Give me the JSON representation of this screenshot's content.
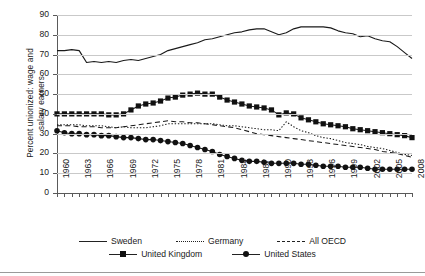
{
  "chart_data": {
    "type": "line",
    "title": "",
    "xlabel": "",
    "ylabel": "Percent unionized: wage and salary earners",
    "ylabel_line1": "Percent unionized: wage and",
    "ylabel_line2": "salary earners",
    "ylim": [
      0,
      90
    ],
    "ytick_step": 10,
    "yticks": [
      0,
      10,
      20,
      30,
      40,
      50,
      60,
      70,
      80,
      90
    ],
    "xlim": [
      1960,
      2008
    ],
    "xtick_step": 1,
    "xlabel_step": 3,
    "xticklabels": [
      "1960",
      "1963",
      "1966",
      "1969",
      "1972",
      "1975",
      "1978",
      "1981",
      "1984",
      "1987",
      "1990",
      "1993",
      "1996",
      "1999",
      "2002",
      "2005",
      "2008"
    ],
    "grid": "horizontal",
    "legend_position": "bottom",
    "x": [
      1960,
      1961,
      1962,
      1963,
      1964,
      1965,
      1966,
      1967,
      1968,
      1969,
      1970,
      1971,
      1972,
      1973,
      1974,
      1975,
      1976,
      1977,
      1978,
      1979,
      1980,
      1981,
      1982,
      1983,
      1984,
      1985,
      1986,
      1987,
      1988,
      1989,
      1990,
      1991,
      1992,
      1993,
      1994,
      1995,
      1996,
      1997,
      1998,
      1999,
      2000,
      2001,
      2002,
      2003,
      2004,
      2005,
      2006,
      2007,
      2008
    ],
    "series": [
      {
        "name": "Sweden",
        "style": "solid",
        "marker": "none",
        "values": [
          72,
          72,
          72.5,
          72,
          66,
          66.5,
          66,
          66.5,
          66,
          67,
          67.5,
          67,
          68,
          69,
          70,
          72,
          73,
          74,
          75,
          76,
          77.5,
          78,
          79,
          80,
          81,
          81.5,
          82.5,
          83,
          83,
          81.5,
          80,
          81,
          83,
          84,
          84,
          84,
          84,
          83.5,
          82,
          81,
          80.5,
          79,
          79.5,
          78,
          77,
          76.5,
          74,
          71,
          68
        ]
      },
      {
        "name": "Germany",
        "style": "dotted",
        "marker": "none",
        "values": [
          34.5,
          34.5,
          34.5,
          34.5,
          34,
          34,
          34,
          33.5,
          33,
          33.5,
          33,
          33,
          33,
          33.5,
          34,
          35,
          35,
          35,
          35,
          35,
          35,
          35,
          34.5,
          34,
          34,
          33.5,
          33,
          32.5,
          32,
          32,
          31.5,
          36,
          33.5,
          31.5,
          30.5,
          29,
          28,
          27.5,
          26.5,
          25.5,
          25,
          24.5,
          23.5,
          23,
          22.5,
          21.5,
          20.5,
          19.5,
          19
        ]
      },
      {
        "name": "All OECD",
        "style": "dashed",
        "marker": "none",
        "values": [
          34,
          34,
          34,
          33.5,
          33.5,
          33.5,
          33,
          33,
          33,
          33.5,
          34,
          34.5,
          35,
          35.5,
          36,
          36.5,
          36,
          36,
          35.5,
          35.5,
          35,
          34.5,
          34,
          33.5,
          33,
          32,
          31,
          30,
          29.5,
          29,
          28.5,
          28,
          27.5,
          27,
          26.5,
          26,
          25.5,
          25,
          24.5,
          24,
          23.5,
          23,
          22.5,
          22,
          21,
          20.5,
          20,
          19,
          18
        ]
      },
      {
        "name": "United Kingdom",
        "style": "solid",
        "marker": "square",
        "values": [
          40,
          40,
          40,
          40,
          40,
          40,
          40,
          39.5,
          39.5,
          40,
          42,
          44,
          45,
          45.5,
          46.5,
          48,
          48.5,
          49.5,
          50,
          50.5,
          50,
          50,
          48.5,
          47,
          46,
          45,
          44,
          43.5,
          43,
          42,
          39.5,
          40.5,
          40,
          38,
          37,
          36,
          35,
          34.5,
          34,
          33.5,
          32.5,
          32,
          31.5,
          31,
          30.5,
          30,
          29.5,
          29,
          28
        ]
      },
      {
        "name": "United States",
        "style": "solid",
        "marker": "circle",
        "values": [
          31.5,
          30.5,
          30,
          30,
          29.5,
          29.5,
          29,
          29,
          28.5,
          28,
          28,
          27.5,
          27,
          27,
          26.5,
          26,
          25.5,
          25,
          24,
          23,
          22,
          21,
          19.5,
          18.5,
          17.5,
          16.5,
          16,
          16,
          15.5,
          15,
          15,
          15,
          15,
          14.5,
          14.5,
          14,
          13.5,
          13.5,
          13.5,
          13,
          13,
          13,
          12.5,
          12,
          12,
          12,
          12,
          12,
          12
        ]
      }
    ]
  },
  "legend": {
    "items": [
      {
        "label": "Sweden",
        "key": "line-solid"
      },
      {
        "label": "Germany",
        "key": "line-dotted"
      },
      {
        "label": "All OECD",
        "key": "line-dashed"
      },
      {
        "label": "United Kingdom",
        "key": "line-square-marker"
      },
      {
        "label": "United States",
        "key": "line-circle-marker"
      }
    ]
  }
}
